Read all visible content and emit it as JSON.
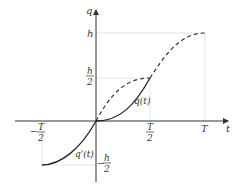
{
  "diagram": {
    "axes": {
      "x_label": "t",
      "y_label": "q"
    },
    "ticks": {
      "x_neg_half_num": "T",
      "x_neg_half_den": "2",
      "x_neg_sign": "−",
      "x_half_num": "T",
      "x_half_den": "2",
      "x_full": "T",
      "y_full": "h",
      "y_half_num": "h",
      "y_half_den": "2",
      "y_neg_half_num": "h",
      "y_neg_half_den": "2",
      "y_neg_sign": "−"
    },
    "curves": {
      "position_label": "q(t)",
      "velocity_label": "q'(t)"
    },
    "colors": {
      "axis": "#333333",
      "curve": "#222222",
      "guide": "#dddddd"
    }
  }
}
